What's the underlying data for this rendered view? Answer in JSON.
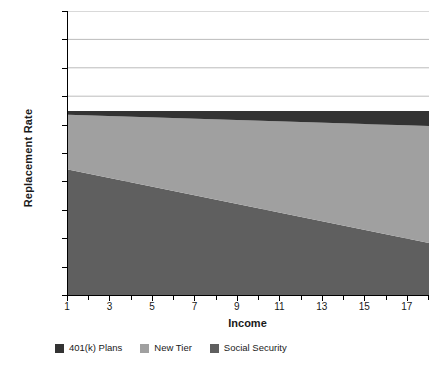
{
  "chart_data": {
    "type": "area",
    "title": "",
    "xlabel": "Income",
    "ylabel": "Replacement Rate",
    "stacked": true,
    "grid": true,
    "legend_position": "bottom",
    "xlim": [
      1,
      18
    ],
    "ylim": [
      0,
      1
    ],
    "x": [
      1,
      18
    ],
    "x_tick_labels": [
      "1",
      "3",
      "5",
      "7",
      "9",
      "11",
      "13",
      "15",
      "17"
    ],
    "x_tick_values": [
      1,
      3,
      5,
      7,
      9,
      11,
      13,
      15,
      17
    ],
    "x_minor_tick_values": [
      2,
      4,
      6,
      8,
      10,
      12,
      14,
      16,
      18
    ],
    "y_tick_labels": [
      "100%",
      "90%",
      "80%",
      "70%",
      "60%",
      "50%",
      "40%",
      "30%",
      "20%",
      "10%",
      "0%"
    ],
    "y_tick_values": [
      1.0,
      0.9,
      0.8,
      0.7,
      0.6,
      0.5,
      0.4,
      0.3,
      0.2,
      0.1,
      0.0
    ],
    "series": [
      {
        "name": "Social Security",
        "color": "#5f5f5f",
        "order": 0,
        "values": [
          0.442,
          0.183
        ]
      },
      {
        "name": "New Tier",
        "color": "#a0a0a0",
        "order": 1,
        "values": [
          0.193,
          0.412
        ]
      },
      {
        "name": "401(k) Plans",
        "color": "#333333",
        "order": 2,
        "values": [
          0.013,
          0.053
        ]
      }
    ],
    "cumulative_top": [
      0.648,
      0.648
    ]
  },
  "axes": {
    "y_title": "Replacement Rate",
    "x_title": "Income"
  },
  "legend": {
    "items": [
      {
        "label": "401(k) Plans",
        "color": "#333333"
      },
      {
        "label": "New Tier",
        "color": "#a0a0a0"
      },
      {
        "label": "Social Security",
        "color": "#5f5f5f"
      }
    ]
  },
  "colors": {
    "grid": "#b4b4b4",
    "axis": "#000000",
    "background": "#ffffff"
  }
}
